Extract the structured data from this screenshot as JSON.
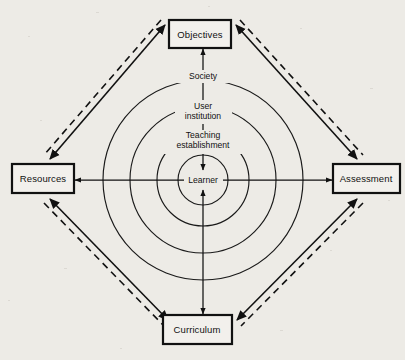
{
  "diagram": {
    "background_color": "#edebe6",
    "ink_color": "#111111",
    "center": {
      "x": 203,
      "y": 180
    },
    "corner_boxes": [
      {
        "id": "objectives",
        "label": "Objectives",
        "position": "top",
        "x": 169,
        "y": 20,
        "width": 62,
        "height": 28
      },
      {
        "id": "resources",
        "label": "Resources",
        "position": "left",
        "x": 12,
        "y": 164,
        "width": 62,
        "height": 29
      },
      {
        "id": "assessment",
        "label": "Assessment",
        "position": "right",
        "x": 333,
        "y": 164,
        "width": 67,
        "height": 29
      },
      {
        "id": "curriculum",
        "label": "Curriculum",
        "position": "bottom",
        "x": 163,
        "y": 315,
        "width": 69,
        "height": 29
      }
    ],
    "rings": [
      {
        "id": "society",
        "label": "Society",
        "radius": 100,
        "label_y": 77
      },
      {
        "id": "user-institution",
        "label": "User\ninstitution",
        "line1": "User",
        "line2": "institution",
        "radius": 73,
        "label_y": 112
      },
      {
        "id": "teaching-establishment",
        "label": "Teaching\nestablishment",
        "line1": "Teaching",
        "line2": "establishment",
        "radius": 46,
        "label_y": 141
      },
      {
        "id": "learner",
        "label": "Learner",
        "radius": 25,
        "label_y": 180
      }
    ],
    "axes": [
      {
        "id": "vertical-axis",
        "from": "Objectives",
        "to": "Curriculum",
        "orientation": "vertical",
        "arrowheads": "both"
      },
      {
        "id": "horizontal-axis",
        "from": "Resources",
        "to": "Assessment",
        "orientation": "horizontal",
        "arrowheads": "both"
      }
    ],
    "perimeter_edges": [
      {
        "id": "objectives-resources",
        "from": "Objectives",
        "to": "Resources",
        "style": "solid-plus-dashed",
        "arrowheads": "both"
      },
      {
        "id": "objectives-assessment",
        "from": "Objectives",
        "to": "Assessment",
        "style": "solid-plus-dashed",
        "arrowheads": "both"
      },
      {
        "id": "resources-curriculum",
        "from": "Resources",
        "to": "Curriculum",
        "style": "solid-plus-dashed",
        "arrowheads": "both"
      },
      {
        "id": "assessment-curriculum",
        "from": "Assessment",
        "to": "Curriculum",
        "style": "solid-plus-dashed",
        "arrowheads": "both"
      }
    ]
  }
}
